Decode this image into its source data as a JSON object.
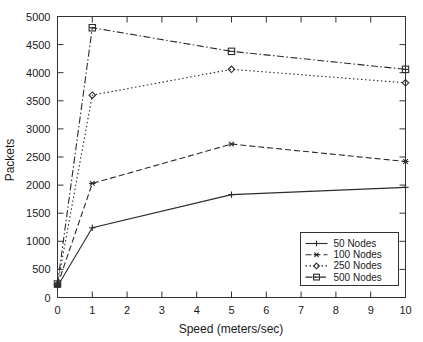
{
  "chart_data": {
    "type": "line",
    "title": "",
    "xlabel": "Speed (meters/sec)",
    "ylabel": "Packets",
    "xlim": [
      0,
      10
    ],
    "ylim": [
      0,
      5000
    ],
    "grid": false,
    "legend_position": "bottom-right",
    "x": [
      0,
      1,
      5,
      10
    ],
    "xticks": [
      "0",
      "1",
      "2",
      "3",
      "4",
      "5",
      "6",
      "7",
      "8",
      "9",
      "10"
    ],
    "xtick_values": [
      0,
      1,
      2,
      3,
      4,
      5,
      6,
      7,
      8,
      9,
      10
    ],
    "yticks": [
      "0",
      "500",
      "1000",
      "1500",
      "2000",
      "2500",
      "3000",
      "3500",
      "4000",
      "4500",
      "5000"
    ],
    "ytick_values": [
      0,
      500,
      1000,
      1500,
      2000,
      2500,
      3000,
      3500,
      4000,
      4500,
      5000
    ],
    "series": [
      {
        "name": "50 Nodes",
        "marker": "plus",
        "dash": "solid",
        "values": [
          200,
          1240,
          1830,
          1960
        ]
      },
      {
        "name": "100 Nodes",
        "marker": "asterisk",
        "dash": "dashed",
        "values": [
          220,
          2030,
          2730,
          2420
        ]
      },
      {
        "name": "250 Nodes",
        "marker": "diamond",
        "dash": "dotted",
        "values": [
          230,
          3600,
          4060,
          3820
        ]
      },
      {
        "name": "500 Nodes",
        "marker": "square-dot",
        "dash": "dashdot",
        "values": [
          240,
          4800,
          4380,
          4060
        ]
      }
    ]
  },
  "legend": {
    "entries": [
      {
        "label": "50 Nodes"
      },
      {
        "label": "100 Nodes"
      },
      {
        "label": "250 Nodes"
      },
      {
        "label": "500 Nodes"
      }
    ]
  },
  "colors": {
    "line": "#2b2b2b",
    "axis": "#333333",
    "background": "#ffffff",
    "text": "#1a1a1a"
  }
}
